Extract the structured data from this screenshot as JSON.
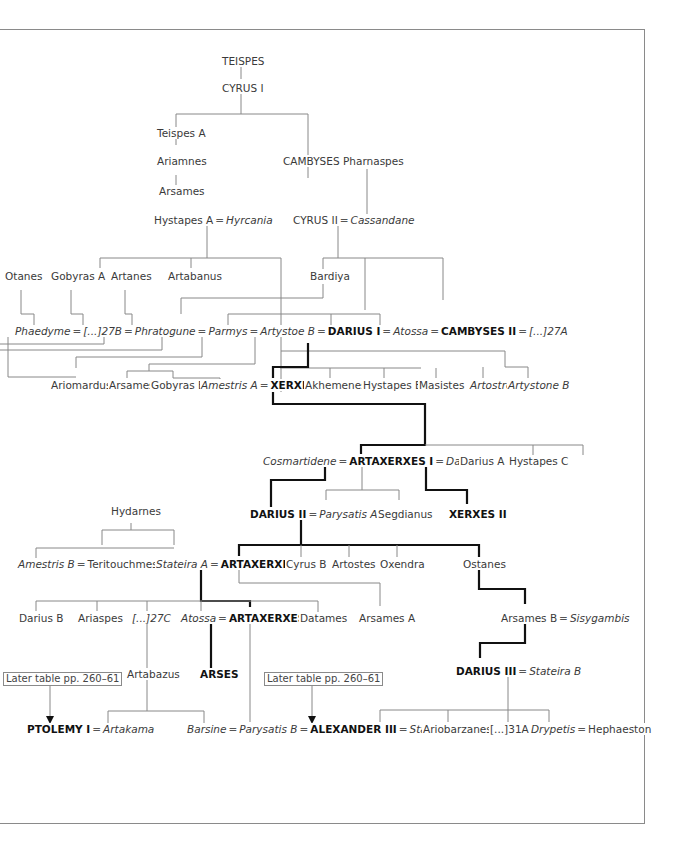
{
  "diagram": {
    "type": "genealogical-tree",
    "nodes": {
      "teispes": "TEISPES",
      "cyrus1": "CYRUS I",
      "teispesA": "Teispes A",
      "ariamnes": "Ariamnes",
      "arsames": "Arsames",
      "hystapesA": "Hystapes A",
      "hyrcania": "Hyrcania",
      "cambyses1": "CAMBYSES I",
      "pharnaspes": "Pharnaspes",
      "cyrus2": "CYRUS II",
      "cassandane": "Cassandane",
      "otanes": "Otanes",
      "gobyrasA": "Gobyras A",
      "artanes": "Artanes",
      "artabanus": "Artabanus",
      "bardiya": "Bardiya",
      "phaedyme": "Phaedyme",
      "u27B": "[...]27B",
      "phratogune": "Phratogune",
      "parmys": "Parmys",
      "artystoeB": "Artystoe B",
      "darius1": "DARIUS I",
      "atossa1": "Atossa",
      "cambyses2": "CAMBYSES II",
      "u27A": "[...]27A",
      "ariomardus": "Ariomardus",
      "arsames2": "Arsames",
      "gobyrasB": "Gobyras B",
      "amestrisA": "Amestris A",
      "xerxes1": "XERXES I",
      "akhemenes": "Akhemenes",
      "hystapesB": "Hystapes B",
      "masistes": "Masistes",
      "artostre": "Artostre",
      "artystoneB": "Artystone B",
      "cosmartidene": "Cosmartidene",
      "artaxerxes1": "ARTAXERXES I",
      "damaspia": "Damaspia",
      "dariusA": "Darius A",
      "hystapesC": "Hystapes C",
      "darius2": "DARIUS II",
      "parysatisA": "Parysatis A",
      "segdianus": "Segdianus",
      "xerxes2": "XERXES II",
      "hydarnes": "Hydarnes",
      "amestrisB": "Amestris B",
      "teritouchmes": "Teritouchmes",
      "stateiraA": "Stateira A",
      "artaxerxes2": "ARTAXERXES II",
      "cyrusB": "Cyrus B",
      "artostes": "Artostes",
      "oxendra": "Oxendra",
      "ostanes": "Ostanes",
      "dariusB": "Darius B",
      "ariaspes": "Ariaspes",
      "u27C": "[...]27C",
      "atossa2": "Atossa",
      "artaxerxes3": "ARTAXERXES III",
      "datames": "Datames",
      "arsamesA": "Arsames  A",
      "arsamesB": "Arsames B",
      "sisygambis": "Sisygambis",
      "artabazus": "Artabazus",
      "arses": "ARSES",
      "darius3": "DARIUS III",
      "stateiraB": "Stateira B",
      "ptolemy1": "PTOLEMY I",
      "artakama": "Artakama",
      "barsine": "Barsine",
      "parysatisB": "Parysatis B",
      "alexander3": "ALEXANDER III",
      "stateiraC": "Stateira C",
      "ariobarzanes": "Ariobarzanes",
      "u31A": "[...]31A",
      "drypetis": "Drypetis",
      "hephaeston": "Hephaeston"
    },
    "marriage_symbol": "=",
    "references": {
      "ref1": "Later table pp. 260–61",
      "ref2": "Later table pp. 260–61"
    },
    "legend": {
      "bold_line": "royal succession",
      "thin_line": "descent",
      "bold_text": "kings",
      "italic_text": "women"
    },
    "colors": {
      "line": "#888888",
      "succession": "#111111",
      "text": "#3a3a3a",
      "frame": "#8a8a8a"
    }
  }
}
